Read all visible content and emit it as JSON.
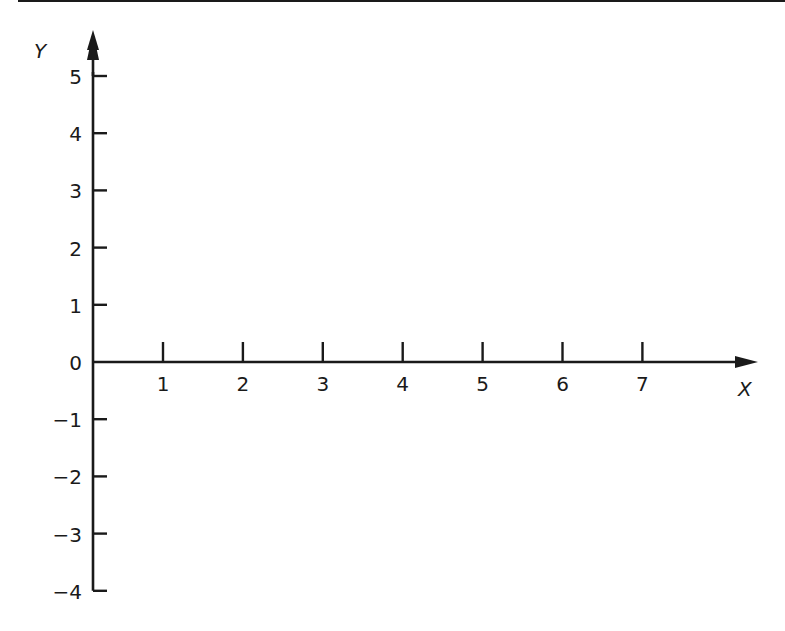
{
  "chart_data": {
    "type": "line",
    "title": "",
    "xlabel": "X",
    "ylabel": "Y",
    "x_ticks": [
      "1",
      "2",
      "3",
      "4",
      "5",
      "6",
      "7"
    ],
    "y_ticks": [
      "5",
      "4",
      "3",
      "2",
      "1",
      "0",
      "−1",
      "−2",
      "−3",
      "−4"
    ],
    "xlim": [
      0,
      8
    ],
    "ylim": [
      -4,
      5.5
    ],
    "grid": false,
    "series": [],
    "note": "Empty coordinate axes with arrows on positive X and Y"
  },
  "colors": {
    "axis": "#1a1a1a",
    "background": "#ffffff"
  }
}
